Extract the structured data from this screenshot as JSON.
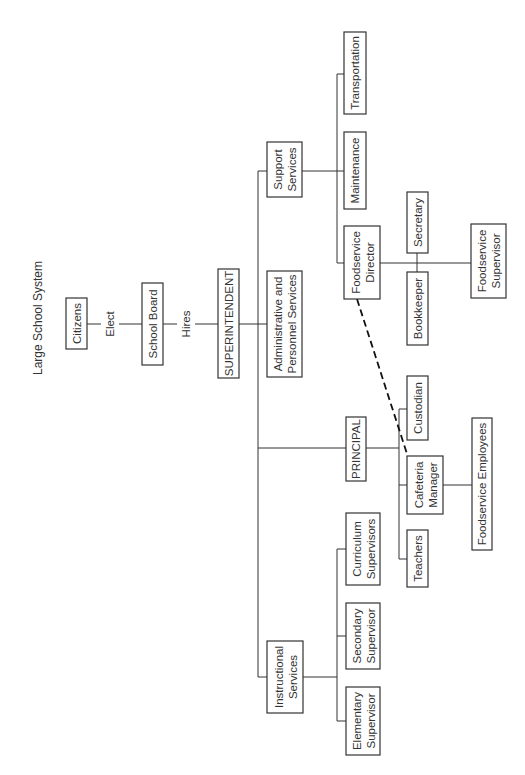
{
  "title": "Large School System",
  "edge_labels": {
    "citizens_to_board": "Elect",
    "board_to_superintendent": "Hires"
  },
  "nodes": {
    "citizens": [
      "Citizens"
    ],
    "school_board": [
      "School Board"
    ],
    "superintendent": [
      "SUPERINTENDENT"
    ],
    "support_services": [
      "Support",
      "Services"
    ],
    "admin_personnel": [
      "Administrative and",
      "Personnel Services"
    ],
    "principal": [
      "PRINCIPAL"
    ],
    "instructional_services": [
      "Instructional",
      "Services"
    ],
    "transportation": [
      "Transportation"
    ],
    "maintenance": [
      "Maintenance"
    ],
    "foodservice_director": [
      "Foodservice",
      "Director"
    ],
    "secretary": [
      "Secretary"
    ],
    "bookkeeper": [
      "Bookkeeper"
    ],
    "foodservice_supervisor": [
      "Foodservice",
      "Supervisor"
    ],
    "custodian": [
      "Custodian"
    ],
    "cafeteria_manager": [
      "Cafeteria",
      "Manager"
    ],
    "teachers": [
      "Teachers"
    ],
    "foodservice_employees": [
      "Foodservice Employees"
    ],
    "curriculum_supervisors": [
      "Curriculum",
      "Supervisors"
    ],
    "secondary_supervisor": [
      "Secondary",
      "Supervisor"
    ],
    "elementary_supervisor": [
      "Elementary",
      "Supervisor"
    ]
  },
  "relationships": [
    {
      "from": "Citizens",
      "to": "School Board",
      "label": "Elect"
    },
    {
      "from": "School Board",
      "to": "SUPERINTENDENT",
      "label": "Hires"
    },
    {
      "from": "SUPERINTENDENT",
      "to": "Support Services"
    },
    {
      "from": "SUPERINTENDENT",
      "to": "Administrative and Personnel Services"
    },
    {
      "from": "SUPERINTENDENT",
      "to": "PRINCIPAL"
    },
    {
      "from": "SUPERINTENDENT",
      "to": "Instructional Services"
    },
    {
      "from": "Support Services",
      "to": "Transportation"
    },
    {
      "from": "Support Services",
      "to": "Maintenance"
    },
    {
      "from": "Support Services",
      "to": "Foodservice Director"
    },
    {
      "from": "Foodservice Director",
      "to": "Secretary"
    },
    {
      "from": "Foodservice Director",
      "to": "Bookkeeper"
    },
    {
      "from": "Foodservice Director",
      "to": "Foodservice Supervisor"
    },
    {
      "from": "Foodservice Director",
      "to": "Cafeteria Manager",
      "style": "dashed"
    },
    {
      "from": "PRINCIPAL",
      "to": "Custodian"
    },
    {
      "from": "PRINCIPAL",
      "to": "Cafeteria Manager"
    },
    {
      "from": "PRINCIPAL",
      "to": "Teachers"
    },
    {
      "from": "Cafeteria Manager",
      "to": "Foodservice Employees"
    },
    {
      "from": "Instructional Services",
      "to": "Curriculum Supervisors"
    },
    {
      "from": "Instructional Services",
      "to": "Secondary Supervisor"
    },
    {
      "from": "Instructional Services",
      "to": "Elementary Supervisor"
    }
  ],
  "colors": {
    "line": "#333333",
    "text": "#333333",
    "background": "#ffffff"
  }
}
